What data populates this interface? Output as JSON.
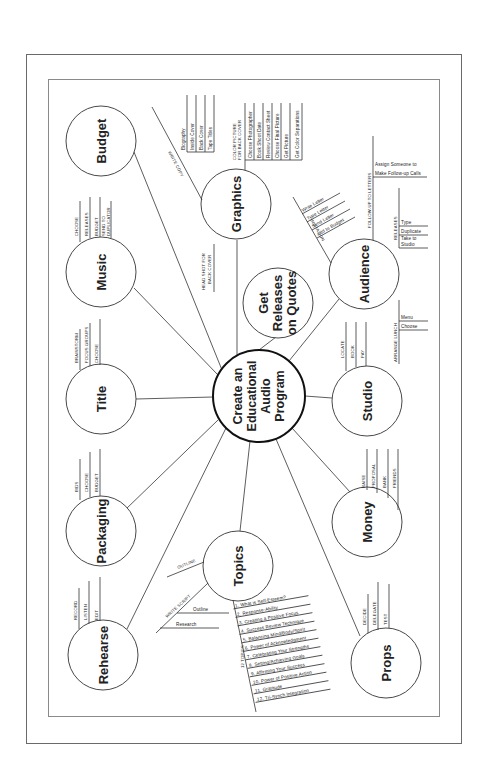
{
  "title": "Create an Educational Audio Program",
  "center": {
    "lines": [
      "Create an",
      "Educational",
      "Audio",
      "Program"
    ]
  },
  "nodes": {
    "budget": {
      "label": "Budget",
      "branches": []
    },
    "music": {
      "label": "Music",
      "branches": [
        "CHOOSE",
        "RELEASES",
        "BUDGET",
        "SEND TO",
        "DUPLICATOR"
      ]
    },
    "title": {
      "label": "Title",
      "branches": [
        "BRAINSTORM",
        "FOCUS GROUPS",
        "CHOOSE"
      ]
    },
    "packaging": {
      "label": "Packaging",
      "branches": [
        "BIDS",
        "CHOOSE",
        "BUDGET"
      ]
    },
    "rehearse": {
      "label": "Rehearse",
      "branches": [
        "RECORD",
        "LISTEN",
        "EDIT"
      ]
    },
    "graphics": {
      "label": "Graphics",
      "write_copy": "WRITE COPY",
      "write_copy_items": [
        "Biography",
        "Inside Cover",
        "Back Cover",
        "Tape Titles"
      ],
      "color_picture": [
        "COLOR PICTURE",
        "FOR BACK COVER"
      ],
      "color_picture_items": [
        "Choose Photographer",
        "Book Shoot Date",
        "Review Contact Sheet",
        "Choose Final Picture",
        "Get Picture",
        "Get Color Separations"
      ],
      "head_shot": [
        "HEAD SHOT FOR",
        "BACK COVER"
      ]
    },
    "releases": {
      "lines": [
        "Get",
        "Releases",
        "on Quotes"
      ]
    },
    "audience": {
      "label": "Audience",
      "invitation": "INVITATION",
      "invitation_items": [
        "Write Letter",
        "Type Letter",
        "Send Letter",
        "Add to Budget"
      ],
      "follow_up": "FOLLOW-UP TO LETTERS",
      "follow_up_items": [
        "Assign Someone to",
        "Make Follow-up Calls"
      ],
      "releases": "RELEASES",
      "releases_items": [
        "Type",
        "Duplicate",
        "Take to",
        "Studio"
      ],
      "arrange_lunch": "ARRANGE LUNCH",
      "arrange_lunch_items": [
        "Menu",
        "Choose"
      ]
    },
    "studio": {
      "label": "Studio",
      "branches": [
        "LOCATE",
        "BOOK",
        "PAY"
      ]
    },
    "money": {
      "label": "Money",
      "branches": [
        "RAISE",
        "PROPOSAL",
        "BANK",
        "FRIENDS"
      ]
    },
    "props": {
      "label": "Props",
      "branches": [
        "DECIDE",
        "DELEGATE",
        "TEST"
      ]
    },
    "topics": {
      "label": "Topics",
      "outline": "OUTLINE",
      "write_script": "WRITE SCRIPT",
      "write_script_items": [
        "Outline",
        "Research"
      ],
      "twelve_topics": "12 TOPICS",
      "topic_list": [
        "1. What is Self-Esteem?",
        "2. Response-Ability",
        "3. Creating a Positive Focus",
        "4. Success Review Technique",
        "5. Balancing Mind/Body/Spirit",
        "6. Power of Acknowledgment",
        "7. Celebrating Your Strengths",
        "8. Setting/Achieving Goals",
        "9. Affirming Your Success",
        "10. Power of Positive Action",
        "11. Gratitude",
        "12. Tri-Synch Integration"
      ]
    }
  }
}
